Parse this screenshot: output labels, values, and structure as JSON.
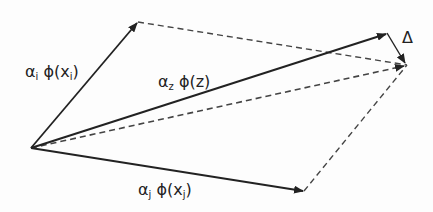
{
  "diagram": {
    "type": "vector-parallelogram",
    "labels": {
      "alpha_i": {
        "greek": "α",
        "sub": "i",
        "phi": " ϕ(x",
        "phi_sub": "i",
        "close": ")"
      },
      "alpha_z": {
        "greek": "α",
        "sub": "z",
        "phi": " ϕ(z)"
      },
      "alpha_j": {
        "greek": "α",
        "sub": "j",
        "phi": " ϕ(x",
        "phi_sub": "j",
        "close": ")"
      },
      "delta": "Δ"
    },
    "colors": {
      "line": "#222222",
      "dashed": "#444444"
    }
  }
}
